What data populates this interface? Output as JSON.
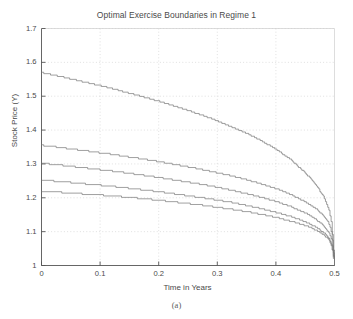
{
  "figure": {
    "caption": "(a)",
    "background": "#ffffff"
  },
  "chart_data": {
    "type": "line",
    "title": "Optimal Exercise Boundaries in Regime 1",
    "xlabel": "Time in Years",
    "ylabel": "Stock Price (Y)",
    "xlim": [
      0,
      0.5
    ],
    "ylim": [
      1,
      1.7
    ],
    "xticks": [
      0,
      0.1,
      0.2,
      0.3,
      0.4,
      0.5
    ],
    "xtick_labels": [
      "0",
      "0.1",
      "0.2",
      "0.3",
      "0.4",
      "0.5"
    ],
    "yticks": [
      1,
      1.1,
      1.2,
      1.3,
      1.4,
      1.5,
      1.6,
      1.7
    ],
    "ytick_labels": [
      "1",
      "1.1",
      "1.2",
      "1.3",
      "1.4",
      "1.5",
      "1.6",
      "1.7"
    ],
    "grid": true,
    "grid_style": "dotted",
    "grid_color": "#d8d8d8",
    "legend": null,
    "line_color": "#777777",
    "line_width": 0.7,
    "step_style": "staircase",
    "x": [
      0.0,
      0.025,
      0.05,
      0.075,
      0.1,
      0.125,
      0.15,
      0.175,
      0.2,
      0.225,
      0.25,
      0.275,
      0.3,
      0.325,
      0.35,
      0.375,
      0.4,
      0.425,
      0.45,
      0.465,
      0.48,
      0.49,
      0.495,
      0.5
    ],
    "series": [
      {
        "name": "boundary-1",
        "values": [
          1.57,
          1.561,
          1.551,
          1.541,
          1.531,
          1.52,
          1.509,
          1.497,
          1.485,
          1.472,
          1.458,
          1.443,
          1.427,
          1.409,
          1.39,
          1.368,
          1.343,
          1.313,
          1.273,
          1.246,
          1.207,
          1.166,
          1.122,
          1.0
        ]
      },
      {
        "name": "boundary-2",
        "values": [
          1.355,
          1.35,
          1.344,
          1.339,
          1.333,
          1.327,
          1.32,
          1.314,
          1.307,
          1.299,
          1.291,
          1.283,
          1.274,
          1.264,
          1.253,
          1.241,
          1.227,
          1.21,
          1.188,
          1.172,
          1.149,
          1.124,
          1.096,
          1.0
        ]
      },
      {
        "name": "boundary-3",
        "values": [
          1.302,
          1.298,
          1.293,
          1.288,
          1.283,
          1.278,
          1.272,
          1.266,
          1.26,
          1.253,
          1.246,
          1.239,
          1.231,
          1.222,
          1.212,
          1.201,
          1.189,
          1.174,
          1.155,
          1.14,
          1.12,
          1.098,
          1.074,
          1.0
        ]
      },
      {
        "name": "boundary-4",
        "values": [
          1.252,
          1.249,
          1.245,
          1.241,
          1.237,
          1.233,
          1.228,
          1.223,
          1.218,
          1.212,
          1.206,
          1.2,
          1.193,
          1.186,
          1.177,
          1.168,
          1.157,
          1.145,
          1.129,
          1.116,
          1.099,
          1.081,
          1.06,
          1.0
        ]
      },
      {
        "name": "boundary-5",
        "values": [
          1.219,
          1.217,
          1.214,
          1.211,
          1.208,
          1.205,
          1.201,
          1.197,
          1.193,
          1.188,
          1.183,
          1.178,
          1.172,
          1.166,
          1.159,
          1.151,
          1.142,
          1.131,
          1.118,
          1.107,
          1.092,
          1.076,
          1.057,
          1.0
        ]
      }
    ]
  }
}
